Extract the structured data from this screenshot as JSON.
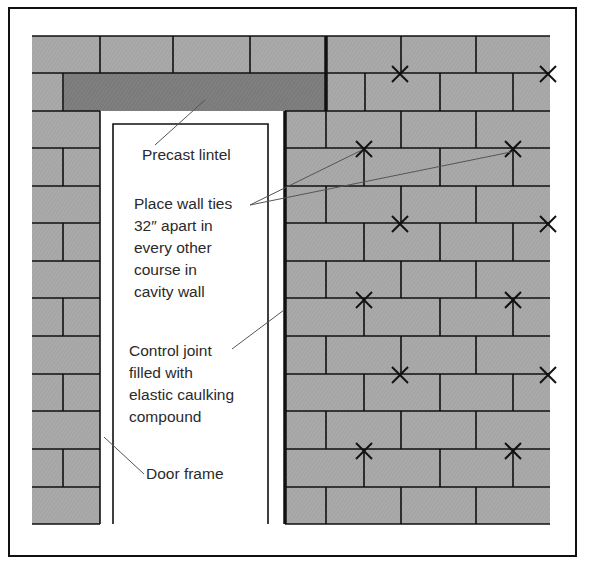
{
  "diagram": {
    "type": "masonry wall elevation with door opening",
    "colors": {
      "brick": "#a9a9a9",
      "lintel": "#7d7d7d",
      "mortar_line": "#111111",
      "leader_line": "#555555",
      "background": "#ffffff",
      "text": "#2a2a2a"
    },
    "labels": [
      {
        "id": "precast-lintel",
        "text": "Precast lintel"
      },
      {
        "id": "wall-ties",
        "text": "Place wall ties\n32″ apart in\nevery other\ncourse in\ncavity wall"
      },
      {
        "id": "control-joint",
        "text": "Control joint\nfilled with\nelastic caulking\ncompound"
      },
      {
        "id": "door-frame",
        "text": "Door frame"
      }
    ],
    "wall_tie_count": 12,
    "wall_tie_marker": "x-mark"
  }
}
